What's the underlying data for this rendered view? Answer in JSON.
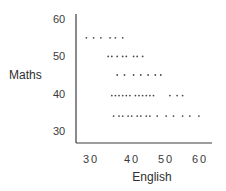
{
  "chart_data": {
    "type": "scatter",
    "title": "",
    "xlabel": "English",
    "ylabel": "Maths",
    "xlim": [
      26,
      63
    ],
    "ylim": [
      28,
      62
    ],
    "x_ticks": [
      30,
      40,
      50,
      60
    ],
    "y_ticks": [
      30,
      40,
      50,
      60
    ],
    "grid": false,
    "legend": null,
    "series": [
      {
        "name": "students",
        "points": [
          {
            "x": 29,
            "y": 55
          },
          {
            "x": 31,
            "y": 55
          },
          {
            "x": 33,
            "y": 55
          },
          {
            "x": 35.5,
            "y": 55
          },
          {
            "x": 37,
            "y": 55
          },
          {
            "x": 39,
            "y": 55
          },
          {
            "x": 35,
            "y": 50
          },
          {
            "x": 36,
            "y": 50
          },
          {
            "x": 37.5,
            "y": 50
          },
          {
            "x": 39,
            "y": 50
          },
          {
            "x": 40,
            "y": 50
          },
          {
            "x": 42,
            "y": 50
          },
          {
            "x": 43,
            "y": 50
          },
          {
            "x": 44.5,
            "y": 50
          },
          {
            "x": 37.5,
            "y": 45
          },
          {
            "x": 39.5,
            "y": 45
          },
          {
            "x": 42,
            "y": 45
          },
          {
            "x": 44,
            "y": 45
          },
          {
            "x": 46,
            "y": 45
          },
          {
            "x": 48,
            "y": 45
          },
          {
            "x": 49.5,
            "y": 45
          },
          {
            "x": 36,
            "y": 39.5
          },
          {
            "x": 37,
            "y": 39.5
          },
          {
            "x": 38,
            "y": 39.5
          },
          {
            "x": 39,
            "y": 39.5
          },
          {
            "x": 40,
            "y": 39.5
          },
          {
            "x": 41,
            "y": 39.5
          },
          {
            "x": 42.5,
            "y": 39.5
          },
          {
            "x": 43.5,
            "y": 39.5
          },
          {
            "x": 44.5,
            "y": 39.5
          },
          {
            "x": 45.5,
            "y": 39.5
          },
          {
            "x": 46.5,
            "y": 39.5
          },
          {
            "x": 47.5,
            "y": 39.5
          },
          {
            "x": 52,
            "y": 39.5
          },
          {
            "x": 54,
            "y": 39.5
          },
          {
            "x": 55.5,
            "y": 39.5
          },
          {
            "x": 36.5,
            "y": 34
          },
          {
            "x": 38,
            "y": 34
          },
          {
            "x": 39,
            "y": 34
          },
          {
            "x": 40.5,
            "y": 34
          },
          {
            "x": 41.5,
            "y": 34
          },
          {
            "x": 43,
            "y": 34
          },
          {
            "x": 44,
            "y": 34
          },
          {
            "x": 45.5,
            "y": 34
          },
          {
            "x": 46.5,
            "y": 34
          },
          {
            "x": 48.5,
            "y": 34
          },
          {
            "x": 51,
            "y": 34
          },
          {
            "x": 53,
            "y": 34
          },
          {
            "x": 55.5,
            "y": 34
          },
          {
            "x": 57.5,
            "y": 34
          },
          {
            "x": 60,
            "y": 34
          }
        ]
      }
    ]
  },
  "labels": {
    "x_title": "English",
    "y_title": "Maths",
    "x_ticks": [
      "30",
      "40",
      "50",
      "60"
    ],
    "y_ticks": [
      "60",
      "50",
      "40",
      "30"
    ]
  },
  "colors": {
    "dot": "#4a4a4a",
    "axis": "#3c3c3c",
    "text": "#333333"
  }
}
